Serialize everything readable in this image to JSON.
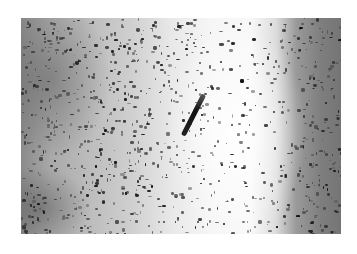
{
  "image": {
    "kind": "grayscale histology micrograph",
    "frame_color": "#ffffff",
    "bounds": {
      "x": 21,
      "y": 18,
      "width": 320,
      "height": 216
    },
    "regions": [
      {
        "name": "left-mottled-tissue",
        "tone": "#9a9a9a"
      },
      {
        "name": "central-bright-band",
        "tone": "#f6f6f6"
      },
      {
        "name": "right-dark-tissue",
        "tone": "#7a7a7a"
      }
    ],
    "features": [
      {
        "name": "diagonal-dark-streak",
        "from": [
          193,
          77
        ],
        "to": [
          174,
          118
        ],
        "color": "#111111"
      }
    ],
    "seed": 7
  }
}
